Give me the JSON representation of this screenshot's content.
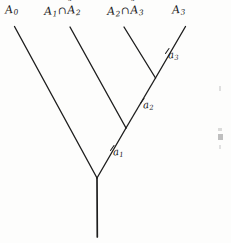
{
  "figure": {
    "kind": "binary-tree-diagram",
    "ink_color": "#1a1a1a",
    "background_color": "#fdfdfc"
  },
  "leaf_labels": [
    {
      "id": "A0",
      "parts": {
        "base": "A",
        "sub": "0",
        "tilde": false
      }
    },
    {
      "id": "A1nA2",
      "parts": {
        "base": "A",
        "sub": "1",
        "operator": "∩",
        "base2": "A",
        "sub2": "2",
        "tilde2": "˜"
      }
    },
    {
      "id": "A2nA3",
      "parts": {
        "base": "A",
        "sub": "2",
        "operator": "∩",
        "base2": "A",
        "sub2": "3",
        "tilde2": "˜"
      }
    },
    {
      "id": "A3",
      "parts": {
        "base": "A",
        "sub": "3",
        "tilde": false
      }
    }
  ],
  "node_labels": [
    {
      "id": "a1",
      "base": "a",
      "sub": "1"
    },
    {
      "id": "a2",
      "base": "a",
      "sub": "2"
    },
    {
      "id": "a3",
      "base": "a",
      "sub": "3"
    }
  ],
  "geometry": {
    "leaf_tips": [
      [
        14,
        26
      ],
      [
        70,
        27
      ],
      [
        124,
        27
      ],
      [
        185,
        27
      ]
    ],
    "junctions": {
      "a1": [
        97,
        178
      ],
      "a2": [
        126,
        128
      ],
      "a3": [
        155,
        78
      ]
    },
    "root_stem": {
      "from": [
        97,
        178
      ],
      "to": [
        97,
        237
      ]
    }
  }
}
